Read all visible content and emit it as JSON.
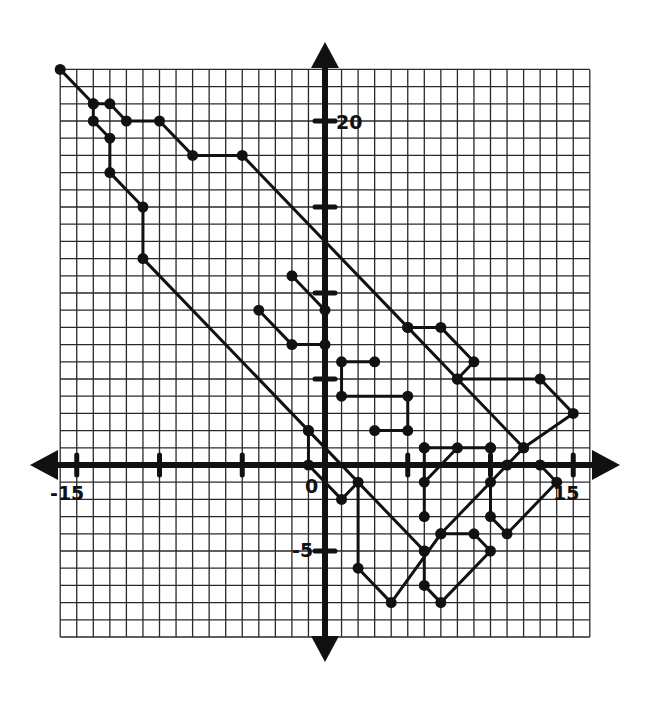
{
  "figure": {
    "type": "coordinate-grid-picture"
  },
  "axes": {
    "x_range": [
      -16,
      16
    ],
    "y_range": [
      -10,
      23
    ],
    "grid_step": 1,
    "x_tick_values": [
      -15,
      -10,
      -5,
      5,
      10,
      15
    ],
    "y_tick_values": [
      -5,
      5,
      10,
      15,
      20
    ],
    "labels": {
      "x_neg15": "-15",
      "x_15": "15",
      "origin": "0",
      "y_20": "20",
      "y_neg5": "-5"
    },
    "colors": {
      "line": "#111111",
      "grid": "#2a2a2a",
      "background": "#ffffff"
    }
  },
  "chart_data": {
    "type": "line",
    "title": "",
    "xlabel": "",
    "ylabel": "",
    "xlim": [
      -16,
      16
    ],
    "ylim": [
      -10,
      23
    ],
    "grid": true,
    "series": [
      {
        "name": "outer-top",
        "points": [
          [
            -16,
            23
          ],
          [
            -14,
            21
          ],
          [
            -13,
            21
          ],
          [
            -12,
            20
          ],
          [
            -10,
            20
          ],
          [
            -8,
            18
          ],
          [
            -5,
            18
          ],
          [
            5,
            8
          ],
          [
            8,
            5
          ],
          [
            12,
            1
          ],
          [
            11,
            0
          ],
          [
            10,
            -1
          ],
          [
            7,
            -4
          ],
          [
            4,
            -8
          ],
          [
            2,
            -6
          ],
          [
            2,
            -1
          ],
          [
            1,
            -2
          ],
          [
            -1,
            0
          ],
          [
            -1,
            2
          ]
        ]
      },
      {
        "name": "outer-left",
        "points": [
          [
            -14,
            21
          ],
          [
            -14,
            20
          ],
          [
            -13,
            19
          ],
          [
            -13,
            17
          ],
          [
            -11,
            15
          ],
          [
            -11,
            12
          ],
          [
            -1,
            2
          ],
          [
            6,
            -5
          ]
        ]
      },
      {
        "name": "crest-a",
        "points": [
          [
            -2,
            11
          ],
          [
            0,
            9
          ]
        ]
      },
      {
        "name": "crest-b",
        "points": [
          [
            -4,
            9
          ],
          [
            -2,
            7
          ],
          [
            0,
            7
          ]
        ]
      },
      {
        "name": "step-shape",
        "points": [
          [
            3,
            6
          ],
          [
            1,
            6
          ],
          [
            1,
            4
          ],
          [
            5,
            4
          ],
          [
            5,
            2
          ],
          [
            3,
            2
          ]
        ]
      },
      {
        "name": "right-fin",
        "points": [
          [
            5,
            8
          ],
          [
            7,
            8
          ],
          [
            9,
            6
          ],
          [
            8,
            5
          ],
          [
            13,
            5
          ],
          [
            15,
            3
          ],
          [
            12,
            1
          ]
        ]
      },
      {
        "name": "belly-box",
        "points": [
          [
            6,
            1
          ],
          [
            10,
            1
          ]
        ]
      },
      {
        "name": "belly-vert",
        "points": [
          [
            6,
            1
          ],
          [
            6,
            -3
          ]
        ]
      },
      {
        "name": "belly-diag",
        "points": [
          [
            6,
            -1
          ],
          [
            8,
            1
          ]
        ]
      },
      {
        "name": "tail-right",
        "points": [
          [
            10,
            1
          ],
          [
            10,
            -3
          ],
          [
            11,
            -4
          ],
          [
            14,
            -1
          ],
          [
            13,
            0
          ]
        ]
      },
      {
        "name": "foot",
        "points": [
          [
            6,
            -5
          ],
          [
            6,
            -7
          ],
          [
            7,
            -8
          ],
          [
            10,
            -5
          ],
          [
            9,
            -4
          ],
          [
            7,
            -4
          ]
        ]
      }
    ]
  }
}
